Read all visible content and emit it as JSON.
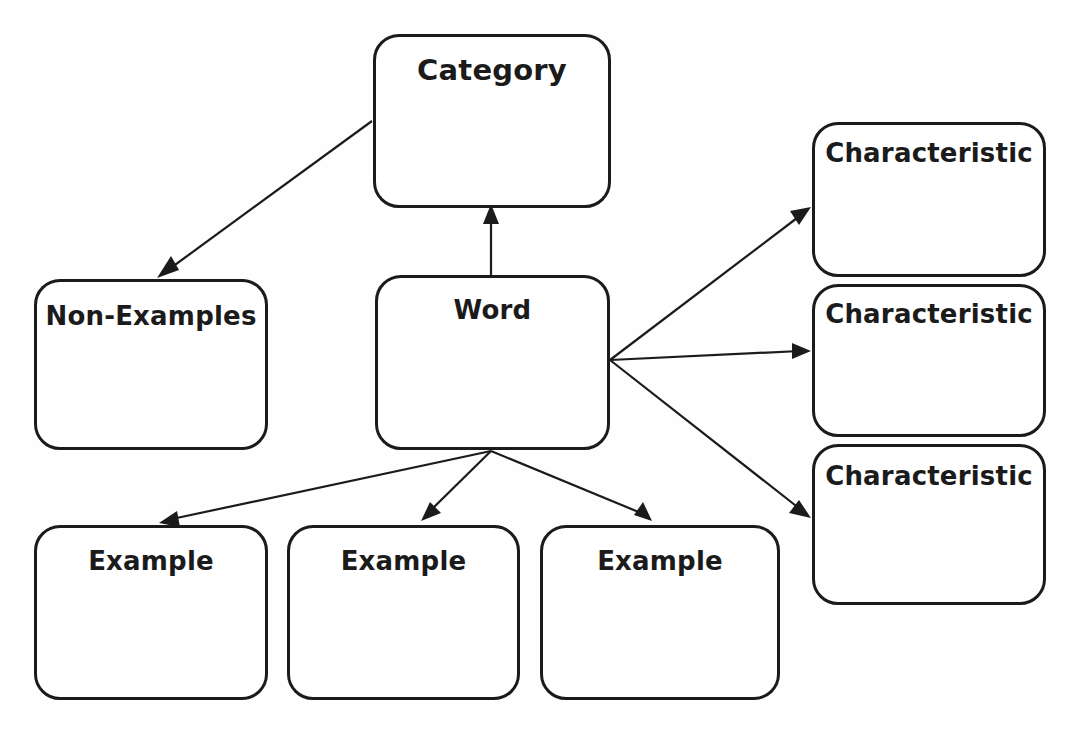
{
  "diagram": {
    "background_color": "#fefefe",
    "line_color": "#1b1b1b",
    "node_fill_color": "#ffffff",
    "nodes": [
      {
        "id": "category",
        "label": "Category"
      },
      {
        "id": "non_examples",
        "label": "Non-Examples"
      },
      {
        "id": "word",
        "label": "Word"
      },
      {
        "id": "char1",
        "label": "Characteristic"
      },
      {
        "id": "char2",
        "label": "Characteristic"
      },
      {
        "id": "char3",
        "label": "Characteristic"
      },
      {
        "id": "example1",
        "label": "Example"
      },
      {
        "id": "example2",
        "label": "Example"
      },
      {
        "id": "example3",
        "label": "Example"
      }
    ],
    "edges": [
      {
        "id": "word-to-category",
        "from": "word",
        "to": "category",
        "arrow": "end"
      },
      {
        "id": "category-to-nonex",
        "from": "category",
        "to": "non_examples",
        "arrow": "end"
      },
      {
        "id": "word-to-char1",
        "from": "word",
        "to": "char1",
        "arrow": "end"
      },
      {
        "id": "word-to-char2",
        "from": "word",
        "to": "char2",
        "arrow": "end"
      },
      {
        "id": "word-to-char3",
        "from": "word",
        "to": "char3",
        "arrow": "end"
      },
      {
        "id": "word-to-example1",
        "from": "word",
        "to": "example1",
        "arrow": "end"
      },
      {
        "id": "word-to-example2",
        "from": "word",
        "to": "example2",
        "arrow": "end"
      },
      {
        "id": "word-to-example3",
        "from": "word",
        "to": "example3",
        "arrow": "end"
      }
    ]
  }
}
